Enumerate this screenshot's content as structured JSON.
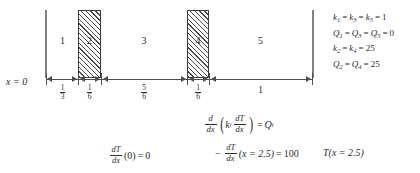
{
  "diagram": {
    "axis_origin_label": "x = 0",
    "regions": [
      {
        "id": "1",
        "label": "1",
        "hatched": false
      },
      {
        "id": "2",
        "label": "2",
        "hatched": true
      },
      {
        "id": "3",
        "label": "3",
        "hatched": false
      },
      {
        "id": "4",
        "label": "4",
        "hatched": true
      },
      {
        "id": "5",
        "label": "5",
        "hatched": false
      }
    ],
    "dimensions": [
      {
        "region": "1",
        "kind": "fraction",
        "numerator": "1",
        "denominator": "3",
        "text": "1/3"
      },
      {
        "region": "2",
        "kind": "fraction",
        "numerator": "1",
        "denominator": "6",
        "text": "1/6"
      },
      {
        "region": "3",
        "kind": "fraction",
        "numerator": "5",
        "denominator": "6",
        "text": "5/6"
      },
      {
        "region": "4",
        "kind": "fraction",
        "numerator": "1",
        "denominator": "6",
        "text": "1/6"
      },
      {
        "region": "5",
        "kind": "whole",
        "text": "1"
      }
    ]
  },
  "legend": {
    "lines": [
      "k₁ = k₃ = k₅ = 1",
      "Q₁ = Q₃ = Q₅ = 0",
      "k₂ = k₄ = 25",
      "Q₂ = Q₄ = 25"
    ],
    "line1": {
      "var": "k",
      "subs": [
        "1",
        "3",
        "5"
      ],
      "value": "1"
    },
    "line2": {
      "var": "Q",
      "subs": [
        "1",
        "3",
        "5"
      ],
      "value": "0"
    },
    "line3": {
      "var": "k",
      "subs": [
        "2",
        "4"
      ],
      "value": "25"
    },
    "line4": {
      "var": "Q",
      "subs": [
        "2",
        "4"
      ],
      "value": "25"
    }
  },
  "equations": {
    "governing": {
      "text": "d/dx ( k_i dT/dx ) = Q_i",
      "d": "d",
      "dx": "dx",
      "k": "k",
      "k_sub": "i",
      "dT": "dT",
      "dT_dx": "dx",
      "equals": "=",
      "Q": "Q",
      "Q_sub": "i"
    },
    "bc_left": {
      "text": "dT/dx (0) = 0",
      "dT": "dT",
      "dx": "dx",
      "arg": "(0)",
      "equals": "=",
      "value": "0"
    },
    "bc_right": {
      "text": "- dT/dx (x = 2.5) = 100",
      "minus": "−",
      "dT": "dT",
      "dx": "dx",
      "arg": "(x = 2.5)",
      "equals": "=",
      "value": "100"
    },
    "bc_temp": {
      "text": "T(x = 2.5)",
      "T": "T",
      "arg": "(x = 2.5)"
    }
  },
  "colors": {
    "ink": "#2b2b2b",
    "rule": "#4d4d4d",
    "boundary": "#808285",
    "hatch": "#4a4a4a",
    "background": "#ffffff"
  }
}
